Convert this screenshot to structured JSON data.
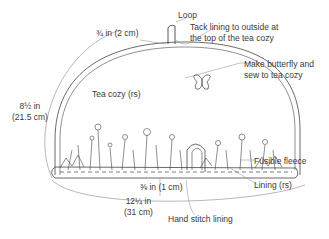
{
  "diagram": {
    "labels": {
      "loop": "Loop",
      "loop_height": "¾ in (2 cm)",
      "tack": [
        "Tack lining to outside at",
        "the top of the tea cozy"
      ],
      "butterfly": [
        "Make butterfly and",
        "sew to tea cozy"
      ],
      "tea_cozy": "Tea cozy (rs)",
      "height": [
        "8½ in",
        "(21.5 cm)"
      ],
      "fusible_fleece": "Fusible fleece",
      "lining": "Lining (rs)",
      "seam": "⅜ in (1 cm)",
      "width": [
        "12¼ in",
        "(31 cm)"
      ],
      "hand_stitch": "Hand stitch lining"
    },
    "colors": {
      "line": "#444444",
      "thin_line": "#888888",
      "text": "#3a3a3a"
    }
  }
}
